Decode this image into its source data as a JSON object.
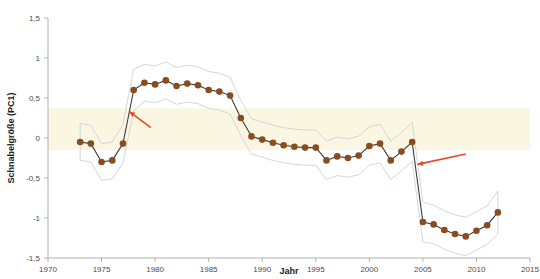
{
  "chart_data": {
    "type": "line",
    "title": "",
    "subtitle": "",
    "xlabel": "Jahr",
    "ylabel": "Schnabelgröße (PC1)",
    "xlim": [
      1970,
      2015
    ],
    "ylim": [
      -1.5,
      1.5
    ],
    "grid": false,
    "legend": null,
    "x_ticks": [
      1970,
      1975,
      1980,
      1985,
      1990,
      1995,
      2000,
      2005,
      2010,
      2015
    ],
    "x_tick_labels": [
      "1970",
      "1975",
      "1980",
      "1985",
      "1990",
      "1995",
      "2000",
      "2005",
      "2010",
      "2015"
    ],
    "y_ticks": [
      -1.5,
      -1,
      -0.5,
      0,
      0.5,
      1,
      1.5
    ],
    "y_tick_labels": [
      "-1,5",
      "-1",
      "-0,5",
      "0",
      "0,5",
      "1",
      "1,5"
    ],
    "series": [
      {
        "name": "Schnabelgröße (PC1)",
        "marker": "filled-circle",
        "color": "#8a4b1e",
        "line_color": "#3a3a3a",
        "x": [
          1973,
          1974,
          1975,
          1976,
          1977,
          1978,
          1979,
          1980,
          1981,
          1982,
          1983,
          1984,
          1985,
          1986,
          1987,
          1988,
          1989,
          1990,
          1991,
          1992,
          1993,
          1994,
          1995,
          1996,
          1997,
          1998,
          1999,
          2000,
          2001,
          2002,
          2003,
          2004,
          2005,
          2006,
          2007,
          2008,
          2009,
          2010,
          2011,
          2012
        ],
        "y": [
          -0.05,
          -0.07,
          -0.3,
          -0.28,
          -0.07,
          0.6,
          0.69,
          0.67,
          0.72,
          0.65,
          0.68,
          0.66,
          0.6,
          0.58,
          0.53,
          0.25,
          0.02,
          -0.02,
          -0.06,
          -0.09,
          -0.11,
          -0.12,
          -0.12,
          -0.28,
          -0.23,
          -0.25,
          -0.22,
          -0.1,
          -0.07,
          -0.28,
          -0.17,
          -0.05,
          -1.05,
          -1.08,
          -1.15,
          -1.2,
          -1.23,
          -1.16,
          -1.09,
          -0.93
        ]
      }
    ],
    "confidence_band": {
      "description": "pale grey-blue 95% confidence envelope around the mean series",
      "color": "#c8d2dc",
      "upper": [
        0.18,
        0.16,
        -0.07,
        -0.05,
        0.17,
        0.86,
        0.92,
        0.9,
        0.95,
        0.88,
        0.91,
        0.89,
        0.83,
        0.81,
        0.76,
        0.47,
        0.24,
        0.2,
        0.16,
        0.13,
        0.11,
        0.1,
        0.1,
        -0.04,
        0.01,
        -0.01,
        0.02,
        0.14,
        0.17,
        -0.04,
        0.07,
        0.19,
        -0.8,
        -0.84,
        -0.91,
        -0.96,
        -0.99,
        -0.92,
        -0.85,
        -0.66
      ],
      "lower": [
        -0.28,
        -0.3,
        -0.53,
        -0.51,
        -0.31,
        0.34,
        0.46,
        0.44,
        0.49,
        0.42,
        0.45,
        0.43,
        0.37,
        0.35,
        0.3,
        0.03,
        -0.2,
        -0.24,
        -0.28,
        -0.31,
        -0.33,
        -0.34,
        -0.34,
        -0.52,
        -0.47,
        -0.49,
        -0.46,
        -0.34,
        -0.31,
        -0.52,
        -0.41,
        -0.29,
        -1.3,
        -1.32,
        -1.39,
        -1.44,
        -1.47,
        -1.4,
        -1.33,
        -1.2
      ]
    },
    "highlight_band": {
      "description": "horizontal cream shaded band spanning the full plot width",
      "color": "#faf6e2",
      "y_from": -0.15,
      "y_to": 0.37
    },
    "annotations": [
      {
        "name": "arrow-rise-1978",
        "type": "arrow",
        "color": "#e8492e",
        "direction": "up-left",
        "target_x": 1977.6,
        "target_y": 0.33,
        "tail_x": 1979.6,
        "tail_y": 0.13
      },
      {
        "name": "arrow-drop-2005",
        "type": "arrow",
        "color": "#e8492e",
        "direction": "down-left",
        "target_x": 2004.5,
        "target_y": -0.33,
        "tail_x": 2009.0,
        "tail_y": -0.2
      }
    ],
    "colors": {
      "marker": "#8a4b1e",
      "line": "#3a3a3a",
      "axis": "#9a9a9a",
      "tick_text": "#4b4b4b",
      "title_text": "#1a1a1a",
      "band": "#faf6e2",
      "ci": "#c8d2dc",
      "arrow": "#e8492e",
      "background": "#ffffff"
    }
  }
}
